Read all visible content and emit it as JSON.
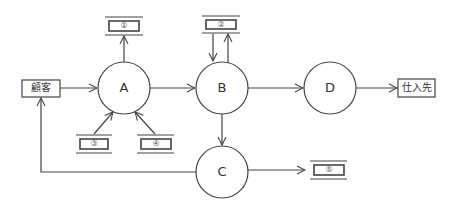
{
  "diagram": {
    "type": "data-flow-diagram",
    "colors": {
      "stroke": "#444444",
      "background": "#ffffff",
      "text": "#333333"
    },
    "external_entities": [
      {
        "id": "customer",
        "label": "顧客"
      },
      {
        "id": "supplier",
        "label": "仕入先"
      }
    ],
    "processes": [
      {
        "id": "A",
        "label": "A"
      },
      {
        "id": "B",
        "label": "B"
      },
      {
        "id": "C",
        "label": "C"
      },
      {
        "id": "D",
        "label": "D"
      }
    ],
    "data_stores": [
      {
        "id": "s1",
        "label": "①"
      },
      {
        "id": "s2",
        "label": "②"
      },
      {
        "id": "s3",
        "label": "③"
      },
      {
        "id": "s4",
        "label": "④"
      },
      {
        "id": "s5",
        "label": "⑤"
      }
    ],
    "flows": [
      {
        "from": "customer",
        "to": "A"
      },
      {
        "from": "A",
        "to": "s1"
      },
      {
        "from": "s3",
        "to": "A"
      },
      {
        "from": "s4",
        "to": "A"
      },
      {
        "from": "A",
        "to": "B"
      },
      {
        "from": "s2",
        "to": "B"
      },
      {
        "from": "B",
        "to": "s2"
      },
      {
        "from": "B",
        "to": "D"
      },
      {
        "from": "D",
        "to": "supplier"
      },
      {
        "from": "B",
        "to": "C"
      },
      {
        "from": "C",
        "to": "s5"
      },
      {
        "from": "C",
        "to": "customer"
      }
    ]
  }
}
